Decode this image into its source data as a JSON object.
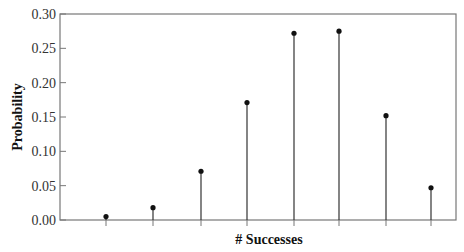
{
  "chart_data": {
    "type": "stem",
    "title": "",
    "xlabel": "# Successes",
    "ylabel": "Probability",
    "ylim": [
      0,
      0.3
    ],
    "yticks": [
      "0.00",
      "0.05",
      "0.10",
      "0.15",
      "0.20",
      "0.25",
      "0.30"
    ],
    "xtick_labels_visible": false,
    "categories": [
      1,
      2,
      3,
      4,
      5,
      6,
      7,
      8
    ],
    "values": [
      0.005,
      0.018,
      0.071,
      0.171,
      0.272,
      0.275,
      0.152,
      0.047
    ],
    "grid": false,
    "legend": null,
    "colors": {
      "stem": "#333333",
      "marker": "#111111",
      "frame": "#777777"
    }
  }
}
